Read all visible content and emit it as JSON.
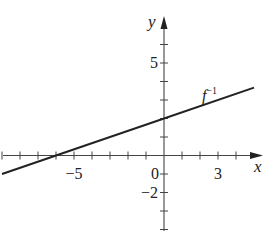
{
  "chart_data": {
    "type": "line",
    "title": "",
    "xlabel": "x",
    "ylabel": "y",
    "xlim": [
      -9,
      5.5
    ],
    "ylim": [
      -4,
      8
    ],
    "grid": false,
    "x_ticks": [
      -9,
      -8,
      -7,
      -6,
      -5,
      -4,
      -3,
      -2,
      -1,
      0,
      1,
      2,
      3,
      4
    ],
    "y_ticks": [
      -4,
      -3,
      -2,
      -1,
      1,
      2,
      3,
      4,
      5,
      6
    ],
    "x_tick_labels": [
      {
        "value": -5,
        "label": "−5"
      },
      {
        "value": 0,
        "label": "0"
      },
      {
        "value": 3,
        "label": "3"
      }
    ],
    "y_tick_labels": [
      {
        "value": 5,
        "label": "5"
      },
      {
        "value": -2,
        "label": "−2"
      }
    ],
    "series": [
      {
        "name": "f⁻¹",
        "label_main": "f",
        "label_sup": "−1",
        "equation": "y = x/3 + 2",
        "x": [
          -9,
          -6,
          0,
          5
        ],
        "values": [
          -1,
          0,
          2,
          3.67
        ],
        "color": "#222222"
      }
    ],
    "annotations": [
      {
        "text": "f⁻¹",
        "near": [
          2.5,
          3.3
        ]
      }
    ]
  }
}
